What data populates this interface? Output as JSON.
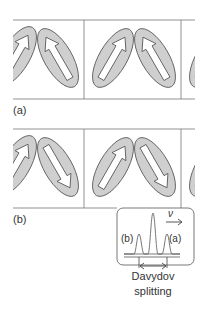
{
  "panels": [
    {
      "label": "(a)",
      "arrow_directions": [
        "up-right",
        "up-left",
        "up-right",
        "up-left"
      ],
      "description": "parallel arrangement"
    },
    {
      "label": "(b)",
      "arrow_directions": [
        "up-right",
        "down-right",
        "up-right",
        "down-right"
      ],
      "description": "antiparallel arrangement"
    }
  ],
  "inset": {
    "axis_label": "ν",
    "left_peak_label": "(b)",
    "right_peak_label": "(a)",
    "caption_line1": "Davydov",
    "caption_line2": "splitting"
  },
  "colors": {
    "ellipse_fill": "#cfcfcf",
    "stroke": "#555555",
    "arrow_fill": "#ffffff",
    "line": "#777777"
  }
}
